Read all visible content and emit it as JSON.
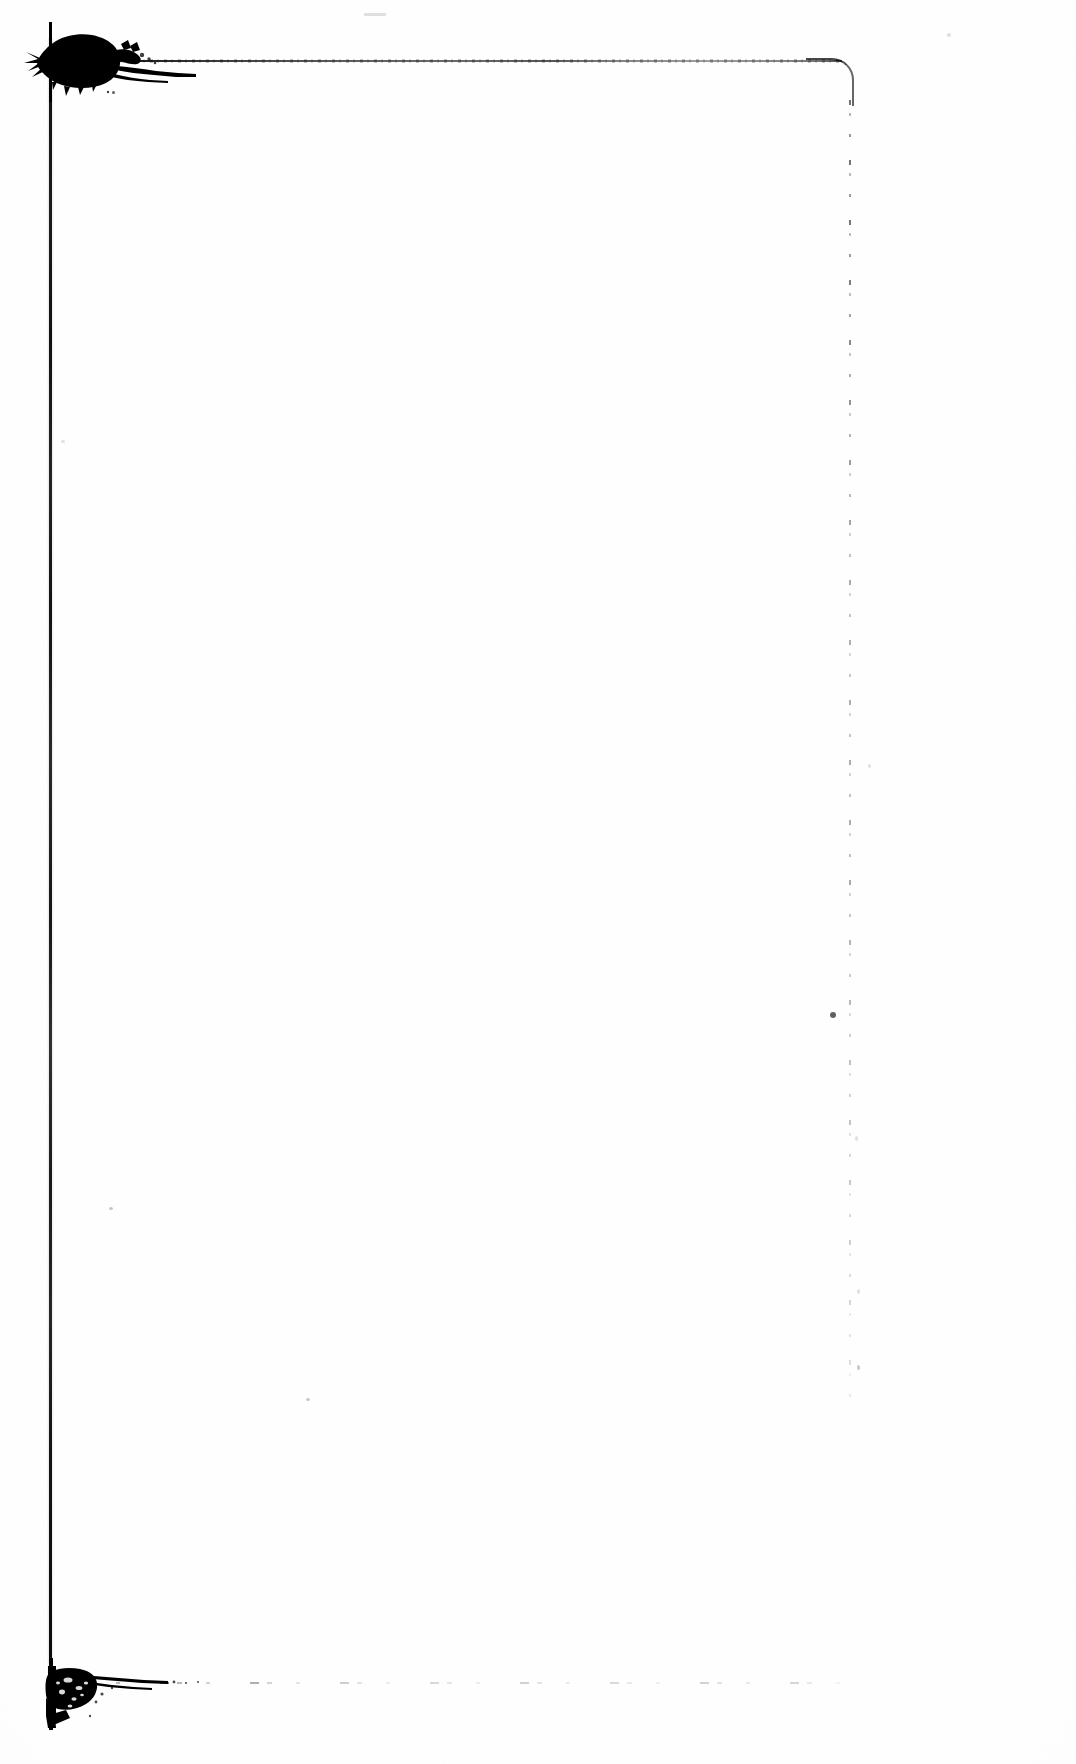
{
  "document": {
    "kind": "scanned-page",
    "title": "Blank scanned page",
    "page_text": "",
    "body_text": "",
    "content_note": "blank page — no printed text",
    "width_px": 1076,
    "height_px": 1764,
    "background_color": "#ffffff",
    "ink_color": "#000000"
  },
  "frame": {
    "name": "ruled border frame",
    "left_rule": {
      "label": "left vertical rule",
      "x": 50,
      "top": 38,
      "bottom": 1718,
      "weight": "heavy-solid",
      "color": "#101010"
    },
    "top_rule": {
      "label": "top horizontal rule",
      "y": 61,
      "left": 52,
      "right": 842,
      "weight": "medium-fading-right",
      "color": "#1a1a1a"
    },
    "right_rule": {
      "label": "right vertical rule",
      "x": 850,
      "top": 100,
      "bottom": 1420,
      "weight": "faint-broken",
      "color": "#555555"
    },
    "bottom_rule": {
      "label": "bottom horizontal rule",
      "y": 1683,
      "left": 70,
      "right": 860,
      "weight": "very-faint-dashed",
      "color": "#777777"
    },
    "corner_top_right": {
      "label": "rounded top-right corner",
      "radius": 22
    }
  },
  "artifacts": {
    "blots": [
      {
        "name": "top-left-ink-blot",
        "x": 33,
        "y": 32,
        "width": 90,
        "height": 56,
        "density": "heavy",
        "description": "dense black ink blot at the top-left frame junction, feathering to the right"
      },
      {
        "name": "bottom-left-ink-blot",
        "x": 36,
        "y": 1668,
        "width": 72,
        "height": 62,
        "density": "heavy-mottled",
        "description": "mottled black ink blot at the bottom-left frame junction"
      }
    ],
    "specks": [
      {
        "name": "speck-right-mid",
        "x": 830,
        "y": 1014,
        "size": 5,
        "tone": "dark"
      },
      {
        "name": "speck-upper-left",
        "x": 113,
        "y": 92,
        "size": 3,
        "tone": "dark"
      },
      {
        "name": "speck-left-lower",
        "x": 110,
        "y": 1208,
        "size": 3,
        "tone": "faint"
      },
      {
        "name": "speck-mid-page",
        "x": 307,
        "y": 1399,
        "size": 3,
        "tone": "faint"
      },
      {
        "name": "speck-top-band",
        "x": 365,
        "y": 14,
        "size": 3,
        "tone": "vfaint"
      },
      {
        "name": "speck-right-col-a",
        "x": 948,
        "y": 34,
        "size": 3,
        "tone": "vfaint"
      },
      {
        "name": "speck-right-col-b",
        "x": 869,
        "y": 765,
        "size": 3,
        "tone": "vfaint"
      },
      {
        "name": "speck-right-col-c",
        "x": 856,
        "y": 1137,
        "size": 3,
        "tone": "vfaint"
      },
      {
        "name": "speck-right-col-d",
        "x": 858,
        "y": 1290,
        "size": 3,
        "tone": "vfaint"
      },
      {
        "name": "speck-left-band",
        "x": 62,
        "y": 441,
        "size": 3,
        "tone": "vfaint"
      },
      {
        "name": "speck-lower-right",
        "x": 858,
        "y": 1366,
        "size": 3,
        "tone": "faint"
      }
    ]
  }
}
